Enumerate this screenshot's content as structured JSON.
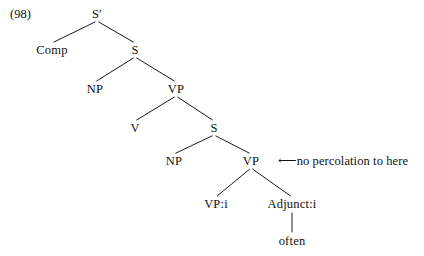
{
  "figure": {
    "example_number": "(98)",
    "type": "syntax-tree",
    "background_color": "#ffffff",
    "line_color": "#1a1a1a",
    "text_color": "#111111"
  },
  "tree": {
    "nodes": [
      {
        "id": "s-bar",
        "label": "S′",
        "x": 97,
        "y": 14
      },
      {
        "id": "comp",
        "label": "Comp",
        "x": 52,
        "y": 50
      },
      {
        "id": "s-upper",
        "label": "S",
        "x": 135,
        "y": 50
      },
      {
        "id": "np-upper",
        "label": "NP",
        "x": 95,
        "y": 89
      },
      {
        "id": "vp-upper",
        "label": "VP",
        "x": 176,
        "y": 89
      },
      {
        "id": "v",
        "label": "V",
        "x": 135,
        "y": 128
      },
      {
        "id": "s-lower",
        "label": "S",
        "x": 214,
        "y": 128
      },
      {
        "id": "np-lower",
        "label": "NP",
        "x": 174,
        "y": 161
      },
      {
        "id": "vp-lower",
        "label": "VP",
        "x": 251,
        "y": 161
      },
      {
        "id": "vp-i",
        "label": "VP:i",
        "x": 216,
        "y": 204
      },
      {
        "id": "adjunct-i",
        "label": "Adjunct:i",
        "x": 292,
        "y": 204
      },
      {
        "id": "often",
        "label": "often",
        "x": 292,
        "y": 241
      }
    ],
    "edges": [
      {
        "from": "s-bar",
        "to": "comp"
      },
      {
        "from": "s-bar",
        "to": "s-upper"
      },
      {
        "from": "s-upper",
        "to": "np-upper"
      },
      {
        "from": "s-upper",
        "to": "vp-upper"
      },
      {
        "from": "vp-upper",
        "to": "v"
      },
      {
        "from": "vp-upper",
        "to": "s-lower"
      },
      {
        "from": "s-lower",
        "to": "np-lower"
      },
      {
        "from": "s-lower",
        "to": "vp-lower"
      },
      {
        "from": "vp-lower",
        "to": "vp-i"
      },
      {
        "from": "vp-lower",
        "to": "adjunct-i"
      },
      {
        "from": "adjunct-i",
        "to": "often"
      }
    ]
  },
  "annotation": {
    "arrow": "⟵",
    "text": "no percolation to here",
    "x": 278,
    "y": 161,
    "points_to": "vp-lower"
  }
}
